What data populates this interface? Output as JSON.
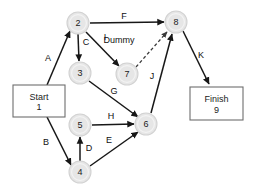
{
  "diagram": {
    "type": "activity-on-arrow-network",
    "nodes": [
      {
        "id": "2",
        "label": "2",
        "cx": 78,
        "cy": 23,
        "r": 11
      },
      {
        "id": "3",
        "label": "3",
        "cx": 80,
        "cy": 73,
        "r": 11
      },
      {
        "id": "4",
        "label": "4",
        "cx": 80,
        "cy": 172,
        "r": 11
      },
      {
        "id": "5",
        "label": "5",
        "cx": 80,
        "cy": 125,
        "r": 11
      },
      {
        "id": "6",
        "label": "6",
        "cx": 146,
        "cy": 124,
        "r": 11
      },
      {
        "id": "7",
        "label": "7",
        "cx": 127,
        "cy": 74,
        "r": 11
      },
      {
        "id": "8",
        "label": "8",
        "cx": 176,
        "cy": 22,
        "r": 11
      }
    ],
    "terminals": [
      {
        "id": "start",
        "x": 13,
        "y": 85,
        "w": 52,
        "h": 32,
        "line1": "Start",
        "line2": "1"
      },
      {
        "id": "finish",
        "x": 190,
        "y": 87,
        "w": 53,
        "h": 33,
        "line1": "Finish",
        "line2": "9"
      }
    ],
    "edges": [
      {
        "id": "A",
        "label": "A",
        "from": "start",
        "to": "2",
        "x1": 47,
        "y1": 85,
        "x2": 70,
        "y2": 31,
        "style": "solid",
        "lx": 48,
        "ly": 58
      },
      {
        "id": "B",
        "label": "B",
        "from": "start",
        "to": "4",
        "x1": 47,
        "y1": 117,
        "x2": 71,
        "y2": 165,
        "style": "solid",
        "lx": 46,
        "ly": 142
      },
      {
        "id": "C",
        "label": "C",
        "from": "2",
        "to": "3",
        "x1": 78,
        "y1": 34,
        "x2": 79,
        "y2": 61,
        "style": "solid",
        "lx": 86,
        "ly": 42
      },
      {
        "id": "D",
        "label": "D",
        "from": "4",
        "to": "5",
        "x1": 80,
        "y1": 161,
        "x2": 80,
        "y2": 137,
        "style": "solid",
        "lx": 89,
        "ly": 148
      },
      {
        "id": "E",
        "label": "E",
        "from": "4",
        "to": "6",
        "x1": 90,
        "y1": 166,
        "x2": 138,
        "y2": 132,
        "style": "solid",
        "lx": 109,
        "ly": 140
      },
      {
        "id": "F",
        "label": "F",
        "from": "2",
        "to": "8",
        "x1": 90,
        "y1": 23,
        "x2": 164,
        "y2": 22,
        "style": "solid",
        "lx": 124,
        "ly": 16
      },
      {
        "id": "G",
        "label": "G",
        "from": "3",
        "to": "6",
        "x1": 89,
        "y1": 81,
        "x2": 138,
        "y2": 117,
        "style": "solid",
        "lx": 114,
        "ly": 91
      },
      {
        "id": "H",
        "label": "H",
        "from": "5",
        "to": "6",
        "x1": 92,
        "y1": 125,
        "x2": 134,
        "y2": 124,
        "style": "solid",
        "lx": 111,
        "ly": 116
      },
      {
        "id": "I",
        "label": "I",
        "from": "2",
        "to": "7",
        "x1": 86,
        "y1": 32,
        "x2": 119,
        "y2": 66,
        "style": "solid",
        "lx": 105,
        "ly": 37
      },
      {
        "id": "J",
        "label": "J",
        "from": "6",
        "to": "8",
        "x1": 151,
        "y1": 113,
        "x2": 172,
        "y2": 34,
        "style": "solid",
        "lx": 152,
        "ly": 76
      },
      {
        "id": "K",
        "label": "K",
        "from": "8",
        "to": "finish",
        "x1": 183,
        "y1": 31,
        "x2": 209,
        "y2": 84,
        "style": "solid",
        "lx": 201,
        "ly": 55
      },
      {
        "id": "Dummy",
        "label": "Dummy",
        "from": "7",
        "to": "8",
        "x1": 136,
        "y1": 67,
        "x2": 167,
        "y2": 32,
        "style": "dashed",
        "lx": 119,
        "ly": 40
      }
    ]
  },
  "colors": {
    "node_fill": "#e6e6e6",
    "node_stroke": "#d2d2d2",
    "edge": "#171717",
    "dummy_edge": "#3a3a3a",
    "box_stroke": "#6e6e6e",
    "text": "#101010",
    "background": "#ffffff"
  }
}
